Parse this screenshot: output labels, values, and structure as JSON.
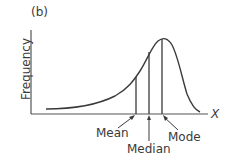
{
  "figure": {
    "panel_label": "(b)",
    "y_axis_label": "Frequency",
    "x_axis_label": "X",
    "annotations": {
      "mean": "Mean",
      "median": "Median",
      "mode": "Mode"
    },
    "colors": {
      "line": "#3a3a3a",
      "background": "#ffffff"
    }
  }
}
